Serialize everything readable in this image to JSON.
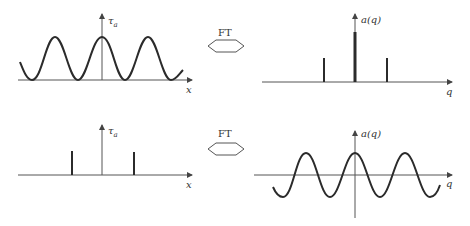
{
  "diagram": {
    "operator_label": "FT",
    "panels": [
      {
        "id": "top-left",
        "ylabel": "τa",
        "xlabel": "x",
        "content": "cosine wave (offset, non-negative)"
      },
      {
        "id": "top-right",
        "ylabel": "a(q)",
        "xlabel": "q",
        "content": "three delta spikes: large at q=0, smaller at ±q0"
      },
      {
        "id": "bottom-left",
        "ylabel": "τa",
        "xlabel": "x",
        "content": "two delta spikes at ±x0"
      },
      {
        "id": "bottom-right",
        "ylabel": "a(q)",
        "xlabel": "q",
        "content": "cosine wave oscillating about zero"
      }
    ]
  },
  "labels": {
    "tau": "τ",
    "tau_sub": "a",
    "aq": "a(q)",
    "x": "x",
    "q": "q",
    "ft_top": "FT",
    "ft_bottom": "FT"
  },
  "colors": {
    "line": "#2b2b2b",
    "axis": "#444444",
    "background": "#ffffff"
  }
}
